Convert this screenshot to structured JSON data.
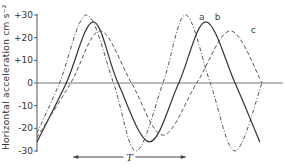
{
  "chart_data": {
    "type": "line",
    "title": "",
    "xlabel": "",
    "ylabel": "Horizontal  acceleration  cm s⁻²",
    "ylim": [
      -30,
      30
    ],
    "yticks": [
      {
        "value": 30,
        "label": "+30"
      },
      {
        "value": 20,
        "label": "+20"
      },
      {
        "value": 10,
        "label": "+10"
      },
      {
        "value": 0,
        "label": "0"
      },
      {
        "value": -10,
        "label": "-10"
      },
      {
        "value": -20,
        "label": "-20"
      },
      {
        "value": -30,
        "label": "-30"
      }
    ],
    "x_units": "time (arbitrary)",
    "xlim": [
      0,
      1
    ],
    "grid": false,
    "series": [
      {
        "name": "a",
        "style": "dash-dot",
        "color": "#555555",
        "points": [
          [
            0.0,
            -22
          ],
          [
            0.1,
            0
          ],
          [
            0.22,
            30
          ],
          [
            0.34,
            0
          ],
          [
            0.44,
            -30
          ],
          [
            0.56,
            0
          ],
          [
            0.66,
            30
          ],
          [
            0.77,
            0
          ],
          [
            0.88,
            -30
          ],
          [
            1.0,
            0
          ]
        ],
        "label_position": [
          0.72,
          28
        ]
      },
      {
        "name": "b",
        "style": "solid",
        "color": "#333333",
        "points": [
          [
            0.0,
            -26
          ],
          [
            0.13,
            0
          ],
          [
            0.25,
            27
          ],
          [
            0.36,
            0
          ],
          [
            0.5,
            -26
          ],
          [
            0.63,
            0
          ],
          [
            0.75,
            27
          ],
          [
            0.88,
            0
          ],
          [
            0.99,
            -26
          ]
        ],
        "label_position": [
          0.79,
          28
        ]
      },
      {
        "name": "c",
        "style": "dashed",
        "color": "#555555",
        "points": [
          [
            0.0,
            -24
          ],
          [
            0.15,
            0
          ],
          [
            0.28,
            23
          ],
          [
            0.42,
            0
          ],
          [
            0.56,
            -23
          ],
          [
            0.71,
            0
          ],
          [
            0.86,
            23
          ],
          [
            1.0,
            0
          ]
        ],
        "label_position": [
          0.95,
          22
        ]
      }
    ],
    "annotations": [
      {
        "type": "double-arrow",
        "label": "T",
        "meaning": "period",
        "from_x": 0.25,
        "to_x": 0.75
      }
    ]
  }
}
